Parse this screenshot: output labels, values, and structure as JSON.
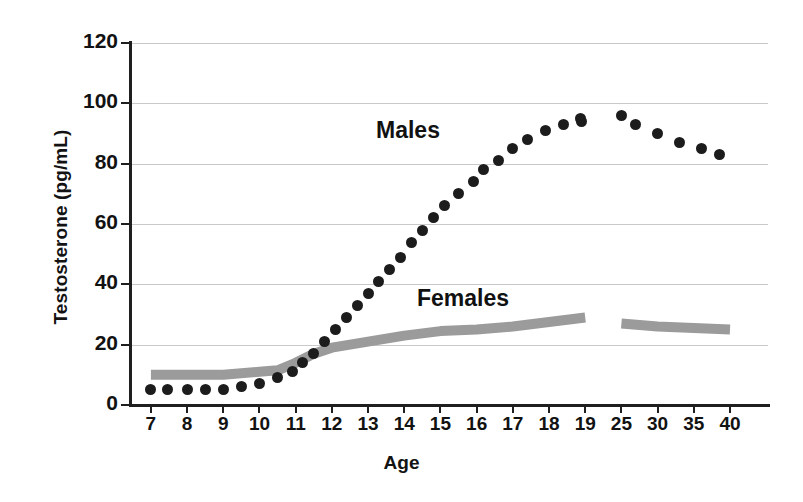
{
  "chart_data": {
    "type": "scatter",
    "title": "",
    "xlabel": "Age",
    "ylabel": "Testosterone (pg/mL)",
    "ylim": [
      0,
      120
    ],
    "yticks": [
      0,
      20,
      40,
      60,
      80,
      100,
      120
    ],
    "grid": true,
    "legend_position": "inline-annotation",
    "categories": [
      "7",
      "8",
      "9",
      "10",
      "11",
      "12",
      "13",
      "14",
      "15",
      "16",
      "17",
      "18",
      "19",
      "25",
      "30",
      "35",
      "40"
    ],
    "axis_break_after_category": "19",
    "series": [
      {
        "name": "Males",
        "style": "dots",
        "color": "#1c1c1c",
        "points": [
          {
            "age": 7.0,
            "value": 5
          },
          {
            "age": 7.45,
            "value": 5
          },
          {
            "age": 8.0,
            "value": 5
          },
          {
            "age": 8.5,
            "value": 5
          },
          {
            "age": 9.0,
            "value": 5
          },
          {
            "age": 9.5,
            "value": 6
          },
          {
            "age": 10.0,
            "value": 7
          },
          {
            "age": 10.5,
            "value": 9
          },
          {
            "age": 10.9,
            "value": 11
          },
          {
            "age": 11.2,
            "value": 14
          },
          {
            "age": 11.5,
            "value": 17
          },
          {
            "age": 11.8,
            "value": 21
          },
          {
            "age": 12.1,
            "value": 25
          },
          {
            "age": 12.4,
            "value": 29
          },
          {
            "age": 12.7,
            "value": 33
          },
          {
            "age": 13.0,
            "value": 37
          },
          {
            "age": 13.3,
            "value": 41
          },
          {
            "age": 13.6,
            "value": 45
          },
          {
            "age": 13.9,
            "value": 49
          },
          {
            "age": 14.2,
            "value": 54
          },
          {
            "age": 14.5,
            "value": 58
          },
          {
            "age": 14.8,
            "value": 62
          },
          {
            "age": 15.1,
            "value": 66
          },
          {
            "age": 15.5,
            "value": 70
          },
          {
            "age": 15.9,
            "value": 74
          },
          {
            "age": 16.2,
            "value": 78
          },
          {
            "age": 16.6,
            "value": 81
          },
          {
            "age": 17.0,
            "value": 85
          },
          {
            "age": 17.4,
            "value": 88
          },
          {
            "age": 17.9,
            "value": 91
          },
          {
            "age": 18.4,
            "value": 93
          },
          {
            "age": 18.9,
            "value": 94
          },
          {
            "age": 19.4,
            "value": 95
          },
          {
            "age": 25.0,
            "value": 96
          },
          {
            "age": 27.0,
            "value": 93
          },
          {
            "age": 30.0,
            "value": 90
          },
          {
            "age": 33.0,
            "value": 87
          },
          {
            "age": 36.0,
            "value": 85
          },
          {
            "age": 38.5,
            "value": 83
          }
        ]
      },
      {
        "name": "Females",
        "style": "thick-band",
        "color": "#9b9b9b",
        "segments": [
          {
            "points": [
              {
                "age": 7,
                "value": 10
              },
              {
                "age": 8,
                "value": 10
              },
              {
                "age": 9,
                "value": 10
              },
              {
                "age": 10,
                "value": 11
              },
              {
                "age": 10.5,
                "value": 11.5
              },
              {
                "age": 11,
                "value": 14
              },
              {
                "age": 11.5,
                "value": 17
              },
              {
                "age": 12,
                "value": 19
              },
              {
                "age": 13,
                "value": 21
              },
              {
                "age": 14,
                "value": 23
              },
              {
                "age": 15,
                "value": 24.5
              },
              {
                "age": 16,
                "value": 25
              },
              {
                "age": 17,
                "value": 26
              },
              {
                "age": 18,
                "value": 27.5
              },
              {
                "age": 19,
                "value": 29
              }
            ]
          },
          {
            "points": [
              {
                "age": 25,
                "value": 27
              },
              {
                "age": 30,
                "value": 26
              },
              {
                "age": 35,
                "value": 25.5
              },
              {
                "age": 40,
                "value": 25
              }
            ]
          }
        ]
      }
    ],
    "annotations": [
      {
        "text": "Males",
        "near": "males-curve"
      },
      {
        "text": "Females",
        "near": "females-band"
      }
    ]
  },
  "axes": {
    "y_title": "Testosterone (pg/mL)",
    "x_title": "Age",
    "y_tick_labels": [
      "120",
      "100",
      "80",
      "60",
      "40",
      "20",
      "0"
    ],
    "x_tick_labels": [
      "7",
      "8",
      "9",
      "10",
      "11",
      "12",
      "13",
      "14",
      "15",
      "16",
      "17",
      "18",
      "19",
      "25",
      "30",
      "35",
      "40"
    ]
  },
  "labels": {
    "males": "Males",
    "females": "Females"
  },
  "colors": {
    "dots": "#1c1c1c",
    "band": "#9b9b9b",
    "grid": "#c9c9c9",
    "axis": "#1f1f1f",
    "text": "#121212",
    "background": "#ffffff"
  }
}
